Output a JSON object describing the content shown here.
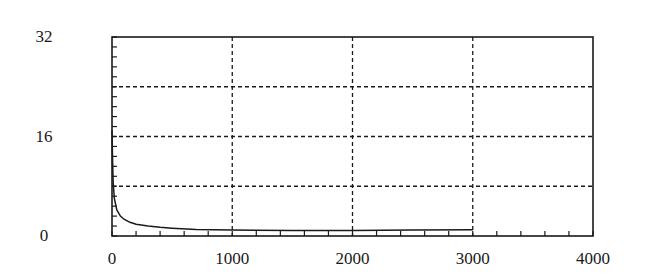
{
  "chart_data": {
    "type": "line",
    "title": "",
    "xlabel": "",
    "ylabel": "",
    "xlim": [
      0,
      4000
    ],
    "ylim": [
      0,
      32
    ],
    "x_ticks": [
      0,
      1000,
      2000,
      3000,
      4000
    ],
    "x_tick_labels": [
      "0",
      "1000",
      "2000",
      "3000",
      "4000"
    ],
    "y_ticks": [
      0,
      16,
      32
    ],
    "y_tick_labels": [
      "0",
      "16",
      "32"
    ],
    "x_minor_tick_step": 200,
    "y_minor_tick_step": 1.6,
    "grid": {
      "on": true,
      "style": "dashed",
      "x_lines": [
        1000,
        2000,
        3000
      ],
      "y_lines": [
        8,
        16,
        24
      ]
    },
    "legend": null,
    "series": [
      {
        "name": "curve",
        "color": "#1a1a1a",
        "x": [
          0,
          5,
          10,
          20,
          40,
          70,
          100,
          150,
          200,
          300,
          400,
          500,
          700,
          1000,
          1500,
          2000,
          2500,
          3000
        ],
        "y": [
          17,
          12,
          8.5,
          6,
          4.2,
          3.2,
          2.7,
          2.2,
          1.9,
          1.6,
          1.4,
          1.25,
          1.05,
          0.95,
          0.9,
          0.9,
          0.95,
          1.0
        ]
      }
    ]
  }
}
